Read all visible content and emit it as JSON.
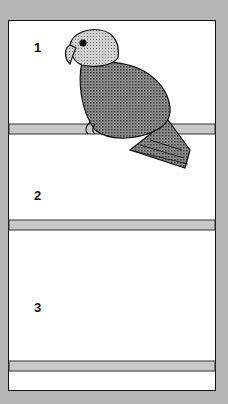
{
  "figure": {
    "background_color": "#b5b5b5",
    "panel_color": "#ffffff",
    "perch_color": "#c8c8c8",
    "birds": [
      {
        "label": "1",
        "description": "short-tailed parrot (lovebird) perched, dark stippled body, lighter head"
      },
      {
        "label": "2",
        "description": "long-tailed parakeet, light stippled body, tail extending down to lowest perch"
      },
      {
        "label": "3",
        "description": "small curved-bill bird (honeyeater/sunbird), mostly black with stippled patches"
      }
    ],
    "annotation": "circle highlighting tip of bird 2's tail on lowest perch"
  }
}
